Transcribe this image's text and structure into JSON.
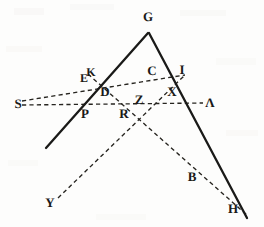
{
  "figure": {
    "width": 264,
    "height": 227,
    "background_color": "#fdfdfc",
    "ink_color": "#1a1a18",
    "dash_color": "#26241f",
    "style": "scanned engraving, solid triangle with dashed construction lines",
    "points": [
      {
        "id": "G",
        "label": "G",
        "x": 148,
        "y": 30,
        "label_x": 148,
        "label_y": 16,
        "role": "apex-vertex"
      },
      {
        "id": "I",
        "label": "I",
        "x": 182,
        "y": 77,
        "label_x": 182,
        "label_y": 69,
        "role": "point-on-right-leg"
      },
      {
        "id": "C",
        "label": "C",
        "x": 156,
        "y": 70,
        "label_x": 152,
        "label_y": 70,
        "role": "intersection"
      },
      {
        "id": "X",
        "label": "X",
        "x": 174,
        "y": 92,
        "label_x": 172,
        "label_y": 91,
        "role": "intersection"
      },
      {
        "id": "Lambda",
        "label": "Λ",
        "x": 201,
        "y": 103,
        "label_x": 210,
        "label_y": 102,
        "role": "right-endpoint"
      },
      {
        "id": "K",
        "label": "K",
        "x": 91,
        "y": 73,
        "label_x": 91,
        "label_y": 72,
        "role": "intersection"
      },
      {
        "id": "E",
        "label": "E",
        "x": 84,
        "y": 78,
        "label_x": 84,
        "label_y": 78,
        "role": "intersection"
      },
      {
        "id": "D",
        "label": "D",
        "x": 105,
        "y": 91,
        "label_x": 105,
        "label_y": 91,
        "role": "intersection"
      },
      {
        "id": "Z",
        "label": "Z",
        "x": 140,
        "y": 100,
        "label_x": 139,
        "label_y": 99,
        "role": "central-intersection"
      },
      {
        "id": "S",
        "label": "S",
        "x": 18,
        "y": 103,
        "label_x": 18,
        "label_y": 103,
        "role": "left-endpoint"
      },
      {
        "id": "P",
        "label": "P",
        "x": 85,
        "y": 113,
        "label_x": 85,
        "label_y": 113,
        "role": "intersection"
      },
      {
        "id": "R",
        "label": "R",
        "x": 124,
        "y": 113,
        "label_x": 124,
        "label_y": 113,
        "role": "intersection"
      },
      {
        "id": "B",
        "label": "B",
        "x": 192,
        "y": 176,
        "label_x": 192,
        "label_y": 176,
        "role": "point-on-dashed"
      },
      {
        "id": "Eta",
        "label": "H",
        "x": 233,
        "y": 208,
        "label_x": 233,
        "label_y": 208,
        "role": "bottom-right-endpoint"
      },
      {
        "id": "Y",
        "label": "Y",
        "x": 50,
        "y": 202,
        "label_x": 50,
        "label_y": 202,
        "role": "bottom-left-endpoint"
      }
    ],
    "solid_segments": [
      {
        "id": "left-leg",
        "name": "G-to-lower-left",
        "x1": 148,
        "y1": 33,
        "x2": 46,
        "y2": 148
      },
      {
        "id": "right-leg",
        "name": "G-to-H-lower-right",
        "x1": 149,
        "y1": 33,
        "x2": 247,
        "y2": 218
      }
    ],
    "dashed_segments": [
      {
        "id": "S-to-I",
        "name": "S-through-EK-C-to-I",
        "x1": 22,
        "y1": 101,
        "x2": 185,
        "y2": 75
      },
      {
        "id": "S-to-Lambda",
        "name": "S-through-P-R-Z-to-Lambda",
        "x1": 22,
        "y1": 105,
        "x2": 203,
        "y2": 103
      },
      {
        "id": "Y-to-I",
        "name": "Y-through-R-Z-X-to-I",
        "x1": 58,
        "y1": 198,
        "x2": 184,
        "y2": 76
      },
      {
        "id": "K-to-Eta",
        "name": "K-through-D-Z-B-to-H",
        "x1": 88,
        "y1": 74,
        "x2": 248,
        "y2": 216
      }
    ]
  }
}
